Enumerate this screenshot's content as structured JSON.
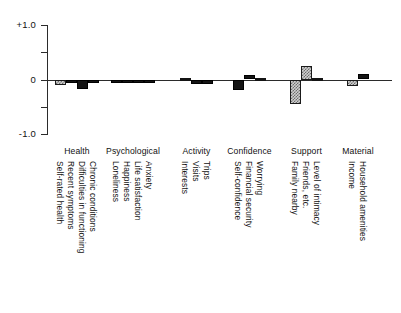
{
  "chart_data": {
    "type": "bar",
    "title": "",
    "subtitle": "",
    "xlabel": "",
    "ylabel": "",
    "ylim": [
      -1.0,
      1.0
    ],
    "yticks": [
      1.0,
      0.5,
      0.0,
      -0.5,
      -1.0
    ],
    "ytick_labels": [
      "+1.0",
      "",
      "0",
      "",
      "-1.0"
    ],
    "grid": false,
    "legend": null,
    "zero_reference_line": true,
    "orientation": "vertical",
    "groups": [
      {
        "name": "Health",
        "categories": [
          "Self-rated health",
          "Recent symptoms",
          "Difficulties in functioning",
          "Chronic conditions"
        ],
        "values": [
          -0.11,
          -0.07,
          -0.17,
          -0.07
        ],
        "fills": [
          "hatch",
          "solid",
          "solid",
          "solid"
        ]
      },
      {
        "name": "Psychological",
        "categories": [
          "Loneliness",
          "Happiness",
          "Life satisfaction",
          "Anxiety"
        ],
        "values": [
          -0.07,
          -0.07,
          -0.07,
          -0.07
        ],
        "fills": [
          "solid",
          "solid",
          "solid",
          "solid"
        ]
      },
      {
        "name": "Activity",
        "categories": [
          "Interests",
          "Visits",
          "Trips"
        ],
        "values": [
          -0.01,
          -0.09,
          -0.09
        ],
        "fills": [
          "solid",
          "solid",
          "solid"
        ]
      },
      {
        "name": "Confidence",
        "categories": [
          "Self-confidence",
          "Financial security",
          "Worrying"
        ],
        "values": [
          -0.2,
          0.08,
          -0.01
        ],
        "fills": [
          "solid",
          "solid",
          "solid"
        ]
      },
      {
        "name": "Support",
        "categories": [
          "Family nearby",
          "Friends, etc.",
          "Level of intimacy"
        ],
        "values": [
          -0.45,
          0.25,
          -0.01
        ],
        "fills": [
          "hatch",
          "hatch",
          "solid"
        ]
      },
      {
        "name": "Material",
        "categories": [
          "Income",
          "Household amenities"
        ],
        "values": [
          -0.12,
          0.1
        ],
        "fills": [
          "hatch",
          "solid"
        ]
      }
    ]
  },
  "axis": {
    "top_label": "+1.0",
    "zero_label": "0",
    "bottom_label": "-1.0"
  }
}
